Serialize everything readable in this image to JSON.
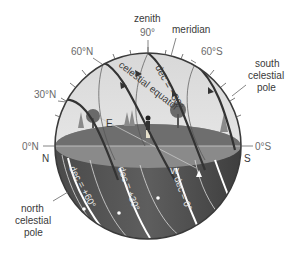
{
  "diagram": {
    "labels": {
      "zenith": "zenith",
      "zenith_angle": "90°",
      "meridian": "meridian",
      "lat_60N": "60°N",
      "lat_30N": "30°N",
      "lat_0N": "0°N",
      "lat_60S": "60°S",
      "lat_0S": "0°S",
      "south_pole_l1": "south",
      "south_pole_l2": "celestial",
      "south_pole_l3": "pole",
      "north_pole_l1": "north",
      "north_pole_l2": "celestial",
      "north_pole_l3": "pole",
      "celestial_equator": "celestial equator",
      "dec_minus30": "dec = −30°",
      "dec_plus60": "dec = +60°",
      "dec_plus30": "dec = +30°",
      "dec_0": "dec = 0°",
      "dir_N": "N",
      "dir_S": "S",
      "dir_E": "E",
      "dir_W": "W"
    },
    "colors": {
      "sky": "#e4e4e4",
      "ground": "#7a7a7a",
      "horizon_plane": "#8c8c8c",
      "below_horizon": "#555555",
      "star_path_dark": "#333333",
      "star_path_light": "#ffffff",
      "label": "#6a6a6a"
    }
  }
}
